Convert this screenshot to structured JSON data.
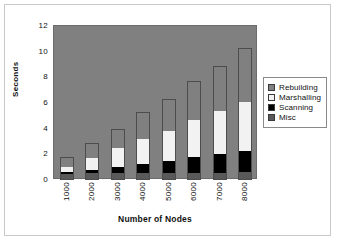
{
  "chart_data": {
    "type": "bar",
    "stacked": true,
    "title": "",
    "xlabel": "Number of Nodes",
    "ylabel": "Seconds",
    "categories": [
      "1000",
      "2000",
      "3000",
      "4000",
      "5000",
      "6000",
      "7000",
      "8000"
    ],
    "yticks": [
      "0",
      "2",
      "4",
      "6",
      "8",
      "10",
      "12"
    ],
    "ylim": [
      0,
      12
    ],
    "grid": false,
    "legend_position": "right",
    "plot_background": "#808080",
    "series": [
      {
        "name": "Misc",
        "color": "#595959",
        "values": [
          0.45,
          0.5,
          0.5,
          0.5,
          0.5,
          0.5,
          0.5,
          0.55
        ]
      },
      {
        "name": "Scanning",
        "color": "#000000",
        "values": [
          0.15,
          0.25,
          0.5,
          0.7,
          0.95,
          1.25,
          1.5,
          1.7
        ]
      },
      {
        "name": "Marshalling",
        "color": "#f2f2f2",
        "values": [
          0.4,
          1.0,
          1.5,
          2.05,
          2.4,
          2.95,
          3.4,
          3.85
        ]
      },
      {
        "name": "Rebuilding",
        "color": "#808080",
        "values": [
          0.8,
          1.15,
          1.5,
          2.05,
          2.45,
          3.05,
          3.5,
          4.2
        ]
      }
    ],
    "totals": [
      1.8,
      2.9,
      4.0,
      5.3,
      6.3,
      7.75,
      8.9,
      10.3
    ]
  },
  "legend": {
    "items": [
      {
        "label": "Rebuilding",
        "swatch": "legend-swatch-rebuilding"
      },
      {
        "label": "Marshalling",
        "swatch": "legend-swatch-marshalling"
      },
      {
        "label": "Scanning",
        "swatch": "legend-swatch-scanning"
      },
      {
        "label": "Misc",
        "swatch": "legend-swatch-misc"
      }
    ]
  }
}
